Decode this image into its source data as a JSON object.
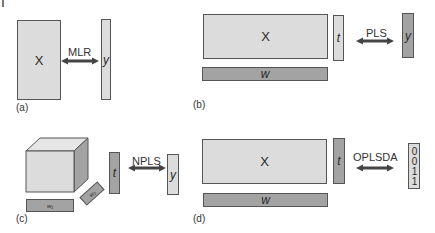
{
  "figure": {
    "corner_mark": "I",
    "colors": {
      "light_fill": "#dcdcdc",
      "dark_fill": "#a3a3a3",
      "stroke": "#555555",
      "arrow": "#444444"
    }
  },
  "panels": {
    "a": {
      "label": "(a)",
      "x_block": "X",
      "method": "MLR",
      "y_block": "y"
    },
    "b": {
      "label": "(b)",
      "x_block": "X",
      "scores": "t",
      "weights": "w",
      "method": "PLS",
      "y_block": "y"
    },
    "c": {
      "label": "(c)",
      "scores": "t",
      "weights_1": "w₁",
      "weights_2": "w₂",
      "method": "NPLS",
      "y_block": "y"
    },
    "d": {
      "label": "(d)",
      "x_block": "X",
      "scores": "t",
      "weights": "w",
      "method": "OPLSDA",
      "y_block": "0011"
    }
  }
}
